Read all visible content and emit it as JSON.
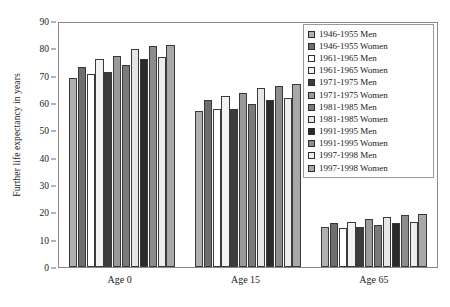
{
  "chart_data": {
    "type": "bar",
    "title": "",
    "xlabel": "",
    "ylabel": "Further life expectancy in years",
    "categories": [
      "Age 0",
      "Age 15",
      "Age 65"
    ],
    "ylim": [
      0,
      90
    ],
    "ytick_step": 10,
    "yticks": [
      0,
      10,
      20,
      30,
      40,
      50,
      60,
      70,
      80,
      90
    ],
    "grid": false,
    "legend_position": "top-right",
    "series": [
      {
        "name": "1946-1955 Men",
        "color": "#b0b0b0",
        "values": [
          69.3,
          57.1,
          14.7
        ]
      },
      {
        "name": "1946-1955 Women",
        "color": "#6e6e6e",
        "values": [
          73.3,
          61.0,
          16.2
        ]
      },
      {
        "name": "1961-1965 Men",
        "color": "#ffffff",
        "values": [
          70.7,
          57.8,
          14.4
        ]
      },
      {
        "name": "1961-1965 Women",
        "color": "#f2f2f2",
        "values": [
          76.0,
          62.7,
          16.6
        ]
      },
      {
        "name": "1971-1975 Men",
        "color": "#3c3c3c",
        "values": [
          71.5,
          57.9,
          14.7
        ]
      },
      {
        "name": "1971-1975 Women",
        "color": "#9a9a9a",
        "values": [
          77.3,
          63.5,
          17.4
        ]
      },
      {
        "name": "1981-1985 Men",
        "color": "#7a7a7a",
        "values": [
          74.0,
          59.6,
          15.2
        ]
      },
      {
        "name": "1981-1985 Women",
        "color": "#e6e6e6",
        "values": [
          79.7,
          65.5,
          18.4
        ]
      },
      {
        "name": "1991-1995 Men",
        "color": "#2a2a2a",
        "values": [
          76.2,
          61.2,
          16.1
        ]
      },
      {
        "name": "1991-1995 Women",
        "color": "#8c8c8c",
        "values": [
          80.7,
          66.4,
          19.0
        ]
      },
      {
        "name": "1997-1998 Men",
        "color": "#ededed",
        "values": [
          76.8,
          62.0,
          16.3
        ]
      },
      {
        "name": "1997-1998 Women",
        "color": "#a8a8a8",
        "values": [
          81.4,
          66.9,
          19.5
        ]
      }
    ]
  }
}
